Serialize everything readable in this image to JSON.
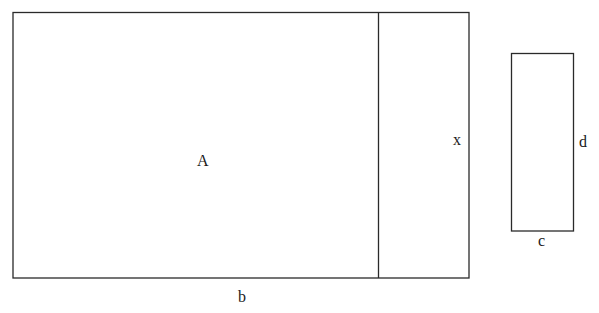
{
  "diagram": {
    "large_rectangle": {
      "area_label": "A",
      "base_label": "b",
      "side_label": "x"
    },
    "small_rectangle": {
      "width_label": "c",
      "height_label": "d"
    },
    "stroke_color": "#2a2a2a",
    "text_color": "#1a1a1a"
  }
}
